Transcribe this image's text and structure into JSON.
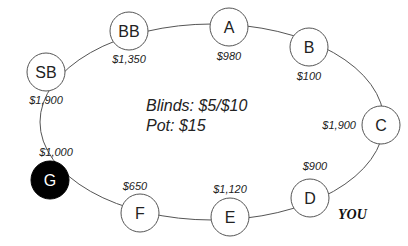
{
  "table": {
    "blinds": "Blinds: $5/$10",
    "pot": "Pot: $15",
    "you_label": "YOU"
  },
  "seats": [
    {
      "name": "SB",
      "stack": "$1,900"
    },
    {
      "name": "BB",
      "stack": "$1,350"
    },
    {
      "name": "A",
      "stack": "$980"
    },
    {
      "name": "B",
      "stack": "$100"
    },
    {
      "name": "C",
      "stack": "$1,900"
    },
    {
      "name": "D",
      "stack": "$900"
    },
    {
      "name": "E",
      "stack": "$1,120"
    },
    {
      "name": "F",
      "stack": "$650"
    },
    {
      "name": "G",
      "stack": "$1,000"
    }
  ],
  "colors": {
    "seat_fill": "#ffffff",
    "active_seat_fill": "#000000",
    "line": "#555555"
  }
}
